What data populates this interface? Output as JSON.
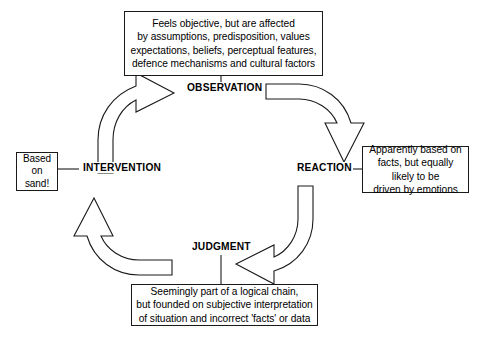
{
  "diagram": {
    "stroke_color": "#1a1a1a",
    "fill_color": "#ffffff",
    "background": "#ffffff",
    "nodes": [
      {
        "id": "observation",
        "label": "OBSERVATION"
      },
      {
        "id": "reaction",
        "label": "REACTION"
      },
      {
        "id": "judgment",
        "label": "JUDGMENT"
      },
      {
        "id": "intervention",
        "label": "INTERVENTION"
      }
    ],
    "notes": {
      "top": {
        "attached_to": "OBSERVATION",
        "lines": [
          "Feels objective, but are affected",
          "by assumptions, predisposition, values",
          "expectations, beliefs, perceptual features,",
          "defence mechanisms and cultural factors"
        ]
      },
      "right": {
        "attached_to": "REACTION",
        "lines": [
          "Apparently based on",
          "facts, but equally",
          "likely to be",
          "driven by emotions"
        ]
      },
      "bottom": {
        "attached_to": "JUDGMENT",
        "lines": [
          "Seemingly part of a logical chain,",
          "but founded on subjective interpretation",
          "of situation and incorrect 'facts' or data"
        ]
      },
      "left": {
        "attached_to": "INTERVENTION",
        "lines": [
          "Based",
          "on",
          "sand!"
        ]
      }
    },
    "flow": [
      {
        "from": "INTERVENTION",
        "to": "OBSERVATION",
        "direction": "clockwise"
      },
      {
        "from": "OBSERVATION",
        "to": "REACTION",
        "direction": "clockwise"
      },
      {
        "from": "REACTION",
        "to": "JUDGMENT",
        "direction": "clockwise"
      },
      {
        "from": "JUDGMENT",
        "to": "INTERVENTION",
        "direction": "clockwise"
      }
    ]
  }
}
